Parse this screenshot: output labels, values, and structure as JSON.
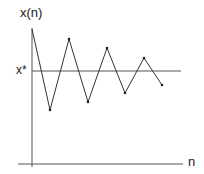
{
  "chart_data": {
    "type": "line",
    "title": "",
    "xlabel": "n",
    "ylabel": "x(n)",
    "reference_line": {
      "label": "x*",
      "value": 0
    },
    "x": [
      0,
      1,
      2,
      3,
      4,
      5,
      6,
      7
    ],
    "series": [
      {
        "name": "x(n)",
        "values": [
          1.0,
          -0.97,
          0.78,
          -0.75,
          0.56,
          -0.53,
          0.32,
          -0.34
        ]
      }
    ],
    "grid": false,
    "legend": null
  },
  "labels": {
    "y_axis": "x(n)",
    "x_axis": "n",
    "fixed_point": "x*"
  },
  "colors": {
    "line": "#333333",
    "axis": "#555555",
    "text": "#1a1a1a"
  },
  "plot": {
    "points_px": [
      [
        32,
        29
      ],
      [
        50,
        110
      ],
      [
        69,
        39
      ],
      [
        88,
        102
      ],
      [
        107,
        48
      ],
      [
        125,
        93
      ],
      [
        144,
        58
      ],
      [
        162,
        85
      ]
    ]
  }
}
